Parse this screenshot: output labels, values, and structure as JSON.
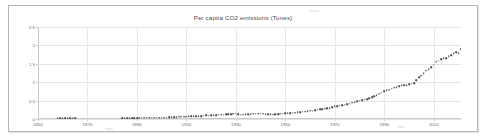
{
  "chart_data": {
    "type": "scatter",
    "title": "Per capita CO2 emissions (Tones)",
    "xlabel": "",
    "ylabel": "",
    "xlim": [
      1850,
      2021
    ],
    "ylim": [
      0,
      2.5
    ],
    "grid": true,
    "legend": null,
    "marker": "small dark square dots forming a dense connected-looking line",
    "series_color": "#4a4a4a",
    "y_ticks": [
      "2.5",
      "2",
      "1.5",
      "1",
      "0.5",
      "0"
    ],
    "y_tick_values": [
      2.5,
      2,
      1.5,
      1,
      0.5,
      0
    ],
    "x_ticks": [
      "1850",
      "1870",
      "1890",
      "1910",
      "1930",
      "1950",
      "1970",
      "1990",
      "2010"
    ],
    "x_tick_values": [
      1850,
      1870,
      1890,
      1910,
      1930,
      1950,
      1970,
      1990,
      2010
    ],
    "series": [
      {
        "name": "Per capita CO2 emissions",
        "x": [
          1858,
          1859,
          1860,
          1861,
          1862,
          1863,
          1864,
          1865,
          1884,
          1885,
          1886,
          1887,
          1888,
          1889,
          1890,
          1891,
          1892,
          1893,
          1894,
          1895,
          1896,
          1897,
          1898,
          1899,
          1900,
          1901,
          1902,
          1903,
          1904,
          1905,
          1906,
          1907,
          1908,
          1909,
          1910,
          1911,
          1912,
          1913,
          1914,
          1915,
          1916,
          1917,
          1918,
          1919,
          1920,
          1921,
          1922,
          1923,
          1924,
          1925,
          1926,
          1927,
          1928,
          1929,
          1930,
          1931,
          1932,
          1933,
          1934,
          1935,
          1936,
          1937,
          1938,
          1939,
          1940,
          1941,
          1942,
          1943,
          1944,
          1945,
          1946,
          1947,
          1948,
          1949,
          1950,
          1951,
          1952,
          1953,
          1954,
          1955,
          1956,
          1957,
          1958,
          1959,
          1960,
          1961,
          1962,
          1963,
          1964,
          1965,
          1966,
          1967,
          1968,
          1969,
          1970,
          1971,
          1972,
          1973,
          1974,
          1975,
          1976,
          1977,
          1978,
          1979,
          1980,
          1981,
          1982,
          1983,
          1984,
          1985,
          1986,
          1987,
          1988,
          1989,
          1990,
          1991,
          1992,
          1993,
          1994,
          1995,
          1996,
          1997,
          1998,
          1999,
          2000,
          2001,
          2002,
          2003,
          2004,
          2005,
          2006,
          2007,
          2008,
          2009,
          2010,
          2011,
          2012,
          2013,
          2014,
          2015,
          2016,
          2017,
          2018,
          2019,
          2020,
          2021
        ],
        "values": [
          0.02,
          0.02,
          0.02,
          0.02,
          0.02,
          0.02,
          0.02,
          0.02,
          0.02,
          0.02,
          0.02,
          0.02,
          0.02,
          0.02,
          0.02,
          0.03,
          0.03,
          0.03,
          0.03,
          0.03,
          0.03,
          0.03,
          0.03,
          0.04,
          0.04,
          0.04,
          0.04,
          0.05,
          0.05,
          0.05,
          0.05,
          0.06,
          0.06,
          0.06,
          0.06,
          0.07,
          0.07,
          0.07,
          0.07,
          0.08,
          0.08,
          0.09,
          0.1,
          0.09,
          0.1,
          0.1,
          0.11,
          0.12,
          0.12,
          0.12,
          0.13,
          0.13,
          0.13,
          0.14,
          0.14,
          0.13,
          0.12,
          0.12,
          0.13,
          0.13,
          0.13,
          0.14,
          0.14,
          0.14,
          0.14,
          0.14,
          0.13,
          0.13,
          0.13,
          0.12,
          0.13,
          0.13,
          0.14,
          0.14,
          0.15,
          0.16,
          0.16,
          0.17,
          0.17,
          0.18,
          0.19,
          0.2,
          0.2,
          0.21,
          0.22,
          0.23,
          0.24,
          0.25,
          0.26,
          0.27,
          0.28,
          0.29,
          0.3,
          0.32,
          0.34,
          0.35,
          0.36,
          0.38,
          0.39,
          0.4,
          0.42,
          0.44,
          0.46,
          0.48,
          0.5,
          0.51,
          0.52,
          0.54,
          0.57,
          0.59,
          0.62,
          0.65,
          0.69,
          0.72,
          0.75,
          0.78,
          0.8,
          0.82,
          0.85,
          0.87,
          0.89,
          0.92,
          0.92,
          0.92,
          0.94,
          0.96,
          0.98,
          1.06,
          1.13,
          1.18,
          1.24,
          1.31,
          1.36,
          1.4,
          1.48,
          1.56,
          1.58,
          1.62,
          1.65,
          1.66,
          1.7,
          1.74,
          1.78,
          1.82,
          1.79,
          1.9
        ]
      }
    ]
  }
}
